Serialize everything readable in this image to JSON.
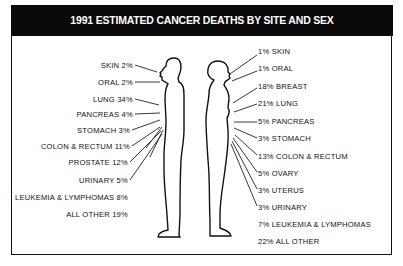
{
  "title": "1991 ESTIMATED CANCER DEATHS BY SITE AND SEX",
  "male": {
    "items": [
      {
        "site": "SKIN",
        "pct": "2%"
      },
      {
        "site": "ORAL",
        "pct": "2%"
      },
      {
        "site": "LUNG",
        "pct": "34%"
      },
      {
        "site": "PANCREAS",
        "pct": "4%"
      },
      {
        "site": "STOMACH",
        "pct": "3%"
      },
      {
        "site": "COLON & RECTUM",
        "pct": "11%"
      },
      {
        "site": "PROSTATE",
        "pct": "12%"
      },
      {
        "site": "URINARY",
        "pct": "5%"
      },
      {
        "site": "LEUKEMIA & LYMPHOMAS",
        "pct": "8%"
      },
      {
        "site": "ALL OTHER",
        "pct": "19%"
      }
    ]
  },
  "female": {
    "items": [
      {
        "site": "SKIN",
        "pct": "1%"
      },
      {
        "site": "ORAL",
        "pct": "1%"
      },
      {
        "site": "BREAST",
        "pct": "18%"
      },
      {
        "site": "LUNG",
        "pct": "21%"
      },
      {
        "site": "PANCREAS",
        "pct": "5%"
      },
      {
        "site": "STOMACH",
        "pct": "3%"
      },
      {
        "site": "COLON & RECTUM",
        "pct": "13%"
      },
      {
        "site": "OVARY",
        "pct": "5%"
      },
      {
        "site": "UTERUS",
        "pct": "3%"
      },
      {
        "site": "URINARY",
        "pct": "3%"
      },
      {
        "site": "LEUKEMIA & LYMPHOMAS",
        "pct": "7%"
      },
      {
        "site": "ALL OTHER",
        "pct": "22%"
      }
    ]
  },
  "labels": {
    "m0": "SKIN  2%",
    "m1": "ORAL  2%",
    "m2": "LUNG  34%",
    "m3": "PANCREAS  4%",
    "m4": "STOMACH  3%",
    "m5": "COLON & RECTUM  11%",
    "m6": "PROSTATE  12%",
    "m7": "URINARY  5%",
    "m8": "LEUKEMIA & LYMPHOMAS  8%",
    "m9": "ALL OTHER  19%",
    "f0": "1%  SKIN",
    "f1": "1%  ORAL",
    "f2": "18%  BREAST",
    "f3": "21%  LUNG",
    "f4": "5%  PANCREAS",
    "f5": "3%  STOMACH",
    "f6": "13%  COLON & RECTUM",
    "f7": "5%  OVARY",
    "f8": "3%  UTERUS",
    "f9": "3%  URINARY",
    "f10": "7%  LEUKEMIA & LYMPHOMAS",
    "f11": "22%  ALL OTHER"
  }
}
